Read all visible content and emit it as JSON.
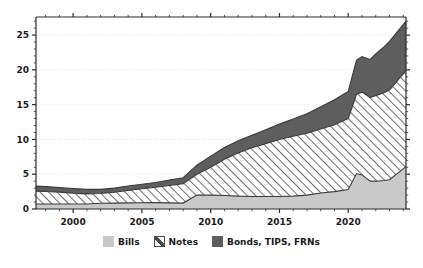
{
  "chart_data": {
    "type": "area",
    "stacked": true,
    "title": "",
    "xlabel": "",
    "ylabel": "",
    "xlim": [
      1997.3,
      2024.2
    ],
    "ylim": [
      0,
      27.6
    ],
    "xticks": [
      2000,
      2005,
      2010,
      2015,
      2020
    ],
    "yticks": [
      0,
      5,
      10,
      15,
      20,
      25
    ],
    "grid": "horizontal-dotted",
    "legend_position": "bottom-center",
    "x": [
      1997.3,
      1998,
      1999,
      2000,
      2001,
      2002,
      2003,
      2004,
      2005,
      2006,
      2007,
      2008,
      2009,
      2010,
      2011,
      2012,
      2013,
      2014,
      2015,
      2016,
      2017,
      2018,
      2019,
      2020,
      2020.6,
      2021,
      2021.6,
      2022,
      2022.6,
      2023,
      2024.2
    ],
    "series": [
      {
        "name": "Bills",
        "color": "#c9c9c9",
        "values": [
          0.72,
          0.72,
          0.72,
          0.72,
          0.72,
          0.82,
          0.85,
          0.88,
          0.9,
          0.92,
          0.88,
          0.85,
          2.0,
          2.0,
          1.95,
          1.85,
          1.8,
          1.8,
          1.8,
          1.85,
          2.0,
          2.3,
          2.5,
          2.8,
          5.1,
          4.9,
          4.0,
          4.0,
          4.1,
          4.2,
          6.1
        ]
      },
      {
        "name": "Notes",
        "color": "#ffffff",
        "pattern": "diagonal-hatch-forward",
        "values": [
          1.85,
          1.8,
          1.7,
          1.55,
          1.45,
          1.4,
          1.55,
          1.8,
          2.0,
          2.2,
          2.5,
          2.8,
          3.0,
          4.0,
          5.2,
          6.2,
          7.0,
          7.6,
          8.2,
          8.6,
          8.9,
          9.2,
          9.6,
          10.2,
          11.4,
          11.9,
          12.0,
          12.3,
          12.6,
          12.9,
          13.8
        ]
      },
      {
        "name": "Bonds, TIPS, FRNs",
        "color": "#5e5e5e",
        "values": [
          0.72,
          0.7,
          0.68,
          0.68,
          0.65,
          0.6,
          0.6,
          0.62,
          0.65,
          0.7,
          0.78,
          0.85,
          1.3,
          1.6,
          1.7,
          1.75,
          1.8,
          2.0,
          2.2,
          2.5,
          2.8,
          3.2,
          3.6,
          3.9,
          4.9,
          5.1,
          5.5,
          6.0,
          6.6,
          7.0,
          7.1
        ]
      }
    ],
    "totals_note": "Stacked totals rise from ~3.3 in 1997 to ~27 in 2024"
  },
  "legend": {
    "items": [
      {
        "label": "Bills",
        "swatch": "bills-swatch"
      },
      {
        "label": "Notes",
        "swatch": "notes-swatch"
      },
      {
        "label": "Bonds, TIPS, FRNs",
        "swatch": "bonds-swatch"
      }
    ]
  },
  "axis": {
    "y_tick_labels": [
      "0",
      "5",
      "10",
      "15",
      "20",
      "25"
    ],
    "x_tick_labels": [
      "2000",
      "2005",
      "2010",
      "2015",
      "2020"
    ]
  },
  "colors": {
    "bills": "#c9c9c9",
    "notes_line": "#4a4a4a",
    "bonds": "#5e5e5e",
    "axis": "#2b2b2b",
    "grid": "#e3e3e8",
    "background": "#ffffff"
  }
}
